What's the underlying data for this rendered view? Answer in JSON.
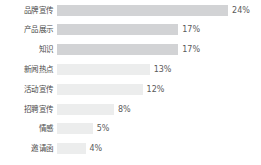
{
  "chart_data": {
    "type": "bar",
    "orientation": "horizontal",
    "title": "",
    "xlabel": "",
    "ylabel": "",
    "grid": false,
    "legend": false,
    "xlim": [
      0,
      28
    ],
    "value_suffix": "%",
    "categories": [
      "品牌宣传",
      "产品展示",
      "知识",
      "新闻热点",
      "活动宣传",
      "招聘宣传",
      "情感",
      "邀请函"
    ],
    "values": [
      24,
      17,
      17,
      13,
      12,
      8,
      5,
      4
    ],
    "value_labels": [
      "24%",
      "17%",
      "17%",
      "13%",
      "12%",
      "8%",
      "5%",
      "4%"
    ],
    "series": [
      {
        "name": "占比",
        "values": [
          24,
          17,
          17,
          13,
          12,
          8,
          5,
          4
        ]
      }
    ],
    "colors": {
      "bar_dark": "#d2d3d5",
      "bar_light": "#eceded",
      "background": "#ffffff",
      "category_text": "#4a4a4a",
      "value_text": "#5a5a5a"
    },
    "emphasis_rows": [
      0,
      1,
      2
    ]
  }
}
